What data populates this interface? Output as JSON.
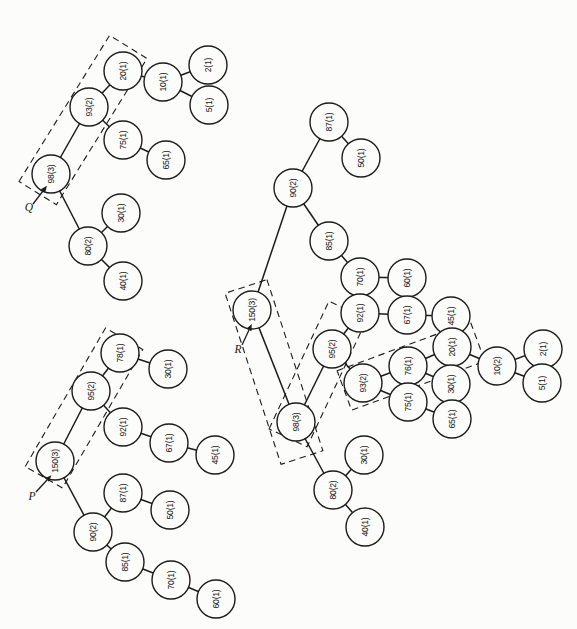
{
  "figure": {
    "background": "#fcfcfa",
    "ink": "#1c1c1c",
    "node_radius": 19,
    "trees": [
      {
        "name": "Q",
        "pointer": {
          "label": "Q",
          "x": 29,
          "y": 211,
          "arrow": {
            "x1": 33,
            "y1": 204,
            "x2": 43,
            "y2": 191
          }
        },
        "dashed_boxes": [
          {
            "cx": 83,
            "cy": 120,
            "length": 172,
            "width": 44,
            "angle": -58.2
          }
        ],
        "nodes": [
          {
            "id": "98",
            "label": "98(3)",
            "x": 51,
            "y": 174
          },
          {
            "id": "93",
            "label": "93(2)",
            "x": 89,
            "y": 107
          },
          {
            "id": "20",
            "label": "20(1)",
            "x": 123,
            "y": 71
          },
          {
            "id": "10",
            "label": "10(1)",
            "x": 163,
            "y": 82
          },
          {
            "id": "2",
            "label": "2(1)",
            "x": 208,
            "y": 65
          },
          {
            "id": "5",
            "label": "5(1)",
            "x": 209,
            "y": 105
          },
          {
            "id": "75",
            "label": "75(1)",
            "x": 123,
            "y": 140
          },
          {
            "id": "65",
            "label": "65(1)",
            "x": 166,
            "y": 160
          },
          {
            "id": "80",
            "label": "80(2)",
            "x": 88,
            "y": 246
          },
          {
            "id": "30",
            "label": "30(1)",
            "x": 121,
            "y": 213
          },
          {
            "id": "40",
            "label": "40(1)",
            "x": 123,
            "y": 281
          }
        ],
        "edges": [
          [
            "98",
            "93"
          ],
          [
            "93",
            "20"
          ],
          [
            "20",
            "10"
          ],
          [
            "10",
            "2"
          ],
          [
            "10",
            "5"
          ],
          [
            "93",
            "75"
          ],
          [
            "75",
            "65"
          ],
          [
            "98",
            "80"
          ],
          [
            "80",
            "30"
          ],
          [
            "80",
            "40"
          ]
        ]
      },
      {
        "name": "P",
        "pointer": {
          "label": "P",
          "x": 32,
          "y": 500,
          "arrow": {
            "x1": 36,
            "y1": 492,
            "x2": 47,
            "y2": 480
          }
        },
        "dashed_boxes": [
          {
            "cx": 84,
            "cy": 408,
            "length": 160,
            "width": 43,
            "angle": -59.9
          }
        ],
        "nodes": [
          {
            "id": "150",
            "label": "150(3)",
            "x": 55,
            "y": 461
          },
          {
            "id": "95",
            "label": "95(2)",
            "x": 91,
            "y": 391
          },
          {
            "id": "78",
            "label": "78(1)",
            "x": 120,
            "y": 353
          },
          {
            "id": "30",
            "label": "30(1)",
            "x": 168,
            "y": 369
          },
          {
            "id": "92",
            "label": "92(1)",
            "x": 123,
            "y": 427
          },
          {
            "id": "67",
            "label": "67(1)",
            "x": 169,
            "y": 443
          },
          {
            "id": "45",
            "label": "45(1)",
            "x": 215,
            "y": 455
          },
          {
            "id": "90",
            "label": "90(2)",
            "x": 93,
            "y": 532
          },
          {
            "id": "87",
            "label": "87(1)",
            "x": 123,
            "y": 493
          },
          {
            "id": "50",
            "label": "50(1)",
            "x": 170,
            "y": 510
          },
          {
            "id": "85",
            "label": "85(1)",
            "x": 125,
            "y": 562
          },
          {
            "id": "70",
            "label": "70(1)",
            "x": 171,
            "y": 580
          },
          {
            "id": "60",
            "label": "60(1)",
            "x": 216,
            "y": 599
          }
        ],
        "edges": [
          [
            "150",
            "95"
          ],
          [
            "95",
            "78"
          ],
          [
            "78",
            "30"
          ],
          [
            "95",
            "92"
          ],
          [
            "92",
            "67"
          ],
          [
            "67",
            "45"
          ],
          [
            "150",
            "90"
          ],
          [
            "90",
            "87"
          ],
          [
            "87",
            "50"
          ],
          [
            "90",
            "85"
          ],
          [
            "85",
            "70"
          ],
          [
            "70",
            "60"
          ]
        ]
      },
      {
        "name": "R",
        "pointer": {
          "label": "R",
          "x": 238,
          "y": 353,
          "arrow": {
            "x1": 242,
            "y1": 345,
            "x2": 249,
            "y2": 330
          }
        },
        "dashed_boxes": [
          {
            "cx": 274,
            "cy": 372,
            "length": 180,
            "width": 44,
            "angle": 71.9
          },
          {
            "cx": 318,
            "cy": 374,
            "length": 141,
            "width": 42,
            "angle": -64.9
          },
          {
            "cx": 411,
            "cy": 366,
            "length": 142,
            "width": 42,
            "angle": -20.2
          }
        ],
        "nodes": [
          {
            "id": "150",
            "label": "150(3)",
            "x": 252,
            "y": 310
          },
          {
            "id": "90",
            "label": "90(2)",
            "x": 293,
            "y": 188
          },
          {
            "id": "87",
            "label": "87(1)",
            "x": 329,
            "y": 122
          },
          {
            "id": "50",
            "label": "50(1)",
            "x": 361,
            "y": 158
          },
          {
            "id": "85",
            "label": "85(1)",
            "x": 329,
            "y": 241
          },
          {
            "id": "70",
            "label": "70(1)",
            "x": 360,
            "y": 277
          },
          {
            "id": "60",
            "label": "60(1)",
            "x": 407,
            "y": 278
          },
          {
            "id": "98",
            "label": "98(3)",
            "x": 296,
            "y": 422
          },
          {
            "id": "95",
            "label": "95(2)",
            "x": 332,
            "y": 349
          },
          {
            "id": "92",
            "label": "92(1)",
            "x": 360,
            "y": 313
          },
          {
            "id": "67",
            "label": "67(1)",
            "x": 407,
            "y": 315
          },
          {
            "id": "45",
            "label": "45(1)",
            "x": 451,
            "y": 316
          },
          {
            "id": "93",
            "label": "93(2)",
            "x": 363,
            "y": 383
          },
          {
            "id": "76",
            "label": "76(1)",
            "x": 408,
            "y": 366
          },
          {
            "id": "20",
            "label": "20(1)",
            "x": 452,
            "y": 347
          },
          {
            "id": "10",
            "label": "10(2)",
            "x": 497,
            "y": 366
          },
          {
            "id": "2",
            "label": "2(1)",
            "x": 543,
            "y": 349
          },
          {
            "id": "5",
            "label": "5(1)",
            "x": 542,
            "y": 383
          },
          {
            "id": "30a",
            "label": "30(1)",
            "x": 451,
            "y": 384
          },
          {
            "id": "75",
            "label": "75(1)",
            "x": 408,
            "y": 402
          },
          {
            "id": "65",
            "label": "65(1)",
            "x": 452,
            "y": 419
          },
          {
            "id": "80",
            "label": "80(2)",
            "x": 333,
            "y": 490
          },
          {
            "id": "30b",
            "label": "30(1)",
            "x": 364,
            "y": 455
          },
          {
            "id": "40",
            "label": "40(1)",
            "x": 365,
            "y": 527
          }
        ],
        "edges": [
          [
            "150",
            "90"
          ],
          [
            "90",
            "87"
          ],
          [
            "87",
            "50"
          ],
          [
            "90",
            "85"
          ],
          [
            "85",
            "70"
          ],
          [
            "70",
            "60"
          ],
          [
            "150",
            "98"
          ],
          [
            "98",
            "95"
          ],
          [
            "95",
            "92"
          ],
          [
            "92",
            "67"
          ],
          [
            "67",
            "45"
          ],
          [
            "95",
            "93"
          ],
          [
            "93",
            "76"
          ],
          [
            "76",
            "20"
          ],
          [
            "20",
            "10"
          ],
          [
            "10",
            "2"
          ],
          [
            "10",
            "5"
          ],
          [
            "76",
            "30a"
          ],
          [
            "93",
            "75"
          ],
          [
            "75",
            "65"
          ],
          [
            "98",
            "80"
          ],
          [
            "80",
            "30b"
          ],
          [
            "80",
            "40"
          ]
        ]
      }
    ]
  }
}
